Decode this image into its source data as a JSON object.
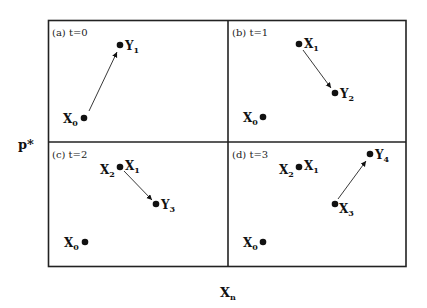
{
  "figure": {
    "y_axis_label": "p*",
    "x_axis_label_main": "X",
    "x_axis_label_sub": "n",
    "panels": [
      {
        "id": "a",
        "label": "(a) t=0",
        "points": [
          {
            "name": "X",
            "sub": "0",
            "label_side": "left"
          },
          {
            "name": "Y",
            "sub": "1",
            "label_side": "right"
          }
        ],
        "arrow": {
          "from": "X0",
          "to": "Y1"
        }
      },
      {
        "id": "b",
        "label": "(b) t=1",
        "points": [
          {
            "name": "X",
            "sub": "1",
            "label_side": "right"
          },
          {
            "name": "Y",
            "sub": "2",
            "label_side": "right"
          },
          {
            "name": "X",
            "sub": "0",
            "label_side": "left"
          }
        ],
        "arrow": {
          "from": "X1",
          "to": "Y2"
        }
      },
      {
        "id": "c",
        "label": "(c) t=2",
        "points": [
          {
            "name": "X",
            "sub": "2",
            "label_side": "left"
          },
          {
            "name": "X",
            "sub": "1",
            "label_side": "right"
          },
          {
            "name": "Y",
            "sub": "3",
            "label_side": "right"
          },
          {
            "name": "X",
            "sub": "0",
            "label_side": "left"
          }
        ],
        "arrow": {
          "from": "X2",
          "to": "Y3"
        }
      },
      {
        "id": "d",
        "label": "(d) t=3",
        "points": [
          {
            "name": "X",
            "sub": "2",
            "label_side": "left"
          },
          {
            "name": "X",
            "sub": "1",
            "label_side": "right"
          },
          {
            "name": "Y",
            "sub": "4",
            "label_side": "right"
          },
          {
            "name": "X",
            "sub": "3",
            "label_side": "right"
          },
          {
            "name": "X",
            "sub": "0",
            "label_side": "left"
          }
        ],
        "arrow": {
          "from": "X3",
          "to": "Y4"
        }
      }
    ]
  }
}
